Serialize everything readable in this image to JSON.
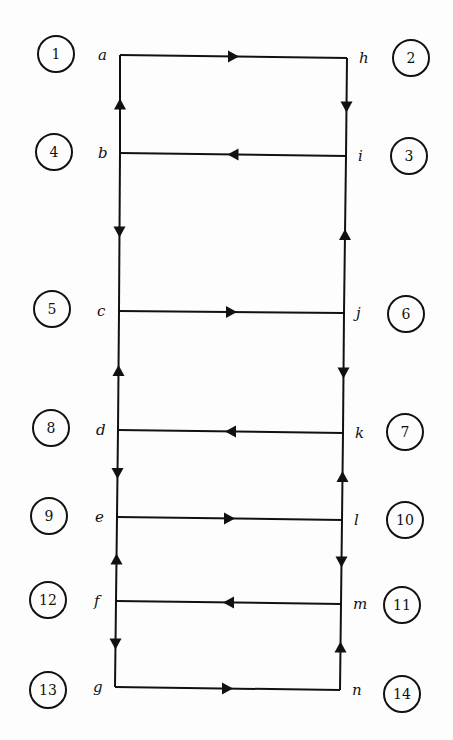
{
  "diagram": {
    "type": "circuit-flow-ladder",
    "line_color": "#111111",
    "background": "#fdfdfd",
    "nodes": {
      "a": {
        "label": "a",
        "x": 120,
        "y": 55
      },
      "b": {
        "label": "b",
        "x": 120,
        "y": 153
      },
      "c": {
        "label": "c",
        "x": 119,
        "y": 311
      },
      "d": {
        "label": "d",
        "x": 118,
        "y": 430
      },
      "e": {
        "label": "e",
        "x": 117,
        "y": 517
      },
      "f": {
        "label": "f",
        "x": 116,
        "y": 601
      },
      "g": {
        "label": "g",
        "x": 115,
        "y": 687
      },
      "h": {
        "label": "h",
        "x": 347,
        "y": 58
      },
      "i": {
        "label": "i",
        "x": 346,
        "y": 156
      },
      "j": {
        "label": "j",
        "x": 344,
        "y": 313
      },
      "k": {
        "label": "k",
        "x": 343,
        "y": 433
      },
      "l": {
        "label": "l",
        "x": 342,
        "y": 520
      },
      "m": {
        "label": "m",
        "x": 341,
        "y": 604
      },
      "n": {
        "label": "n",
        "x": 340,
        "y": 690
      }
    },
    "edges": [
      {
        "from": "a",
        "to": "h",
        "arrow": "right"
      },
      {
        "from": "h",
        "to": "i",
        "arrow": "down"
      },
      {
        "from": "i",
        "to": "b",
        "arrow": "left"
      },
      {
        "from": "b",
        "to": "a",
        "arrow": "up"
      },
      {
        "from": "b",
        "to": "c",
        "arrow": "down"
      },
      {
        "from": "c",
        "to": "j",
        "arrow": "right"
      },
      {
        "from": "j",
        "to": "i",
        "arrow": "up"
      },
      {
        "from": "j",
        "to": "k",
        "arrow": "down"
      },
      {
        "from": "k",
        "to": "d",
        "arrow": "left"
      },
      {
        "from": "d",
        "to": "c",
        "arrow": "up"
      },
      {
        "from": "d",
        "to": "e",
        "arrow": "down"
      },
      {
        "from": "e",
        "to": "l",
        "arrow": "right"
      },
      {
        "from": "l",
        "to": "k",
        "arrow": "up"
      },
      {
        "from": "l",
        "to": "m",
        "arrow": "down"
      },
      {
        "from": "m",
        "to": "f",
        "arrow": "left"
      },
      {
        "from": "f",
        "to": "e",
        "arrow": "up"
      },
      {
        "from": "f",
        "to": "g",
        "arrow": "down"
      },
      {
        "from": "g",
        "to": "n",
        "arrow": "right"
      },
      {
        "from": "n",
        "to": "m",
        "arrow": "up"
      }
    ],
    "step_circles": [
      {
        "label": "1",
        "x": 56,
        "y": 54
      },
      {
        "label": "2",
        "x": 411,
        "y": 58
      },
      {
        "label": "4",
        "x": 54,
        "y": 152
      },
      {
        "label": "3",
        "x": 409,
        "y": 156
      },
      {
        "label": "5",
        "x": 52,
        "y": 309
      },
      {
        "label": "6",
        "x": 406,
        "y": 314
      },
      {
        "label": "8",
        "x": 51,
        "y": 428
      },
      {
        "label": "7",
        "x": 405,
        "y": 432
      },
      {
        "label": "9",
        "x": 49,
        "y": 516
      },
      {
        "label": "10",
        "x": 405,
        "y": 520
      },
      {
        "label": "12",
        "x": 48,
        "y": 600
      },
      {
        "label": "11",
        "x": 402,
        "y": 605
      },
      {
        "label": "13",
        "x": 48,
        "y": 690
      },
      {
        "label": "14",
        "x": 402,
        "y": 694
      }
    ]
  }
}
